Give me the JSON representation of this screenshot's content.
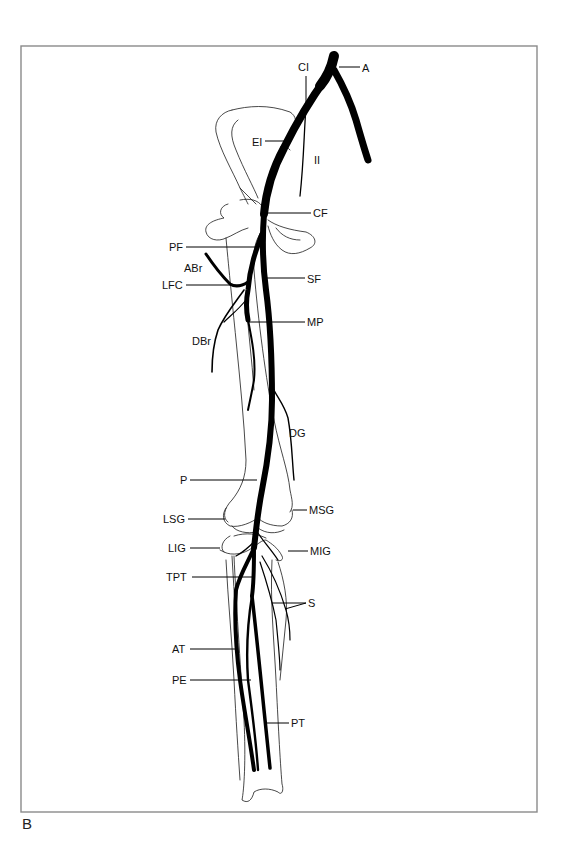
{
  "figure": {
    "panel_letter": "B",
    "frame": {
      "x": 21,
      "y": 46,
      "width": 516,
      "height": 766
    }
  },
  "labels": [
    {
      "id": "A",
      "text": "A",
      "tx": 362,
      "ty": 72,
      "line": [
        [
          339,
          67
        ],
        [
          360,
          67
        ]
      ]
    },
    {
      "id": "CI",
      "text": "CI",
      "tx": 298,
      "ty": 71,
      "line": [
        [
          306,
          76
        ],
        [
          306,
          104
        ]
      ]
    },
    {
      "id": "EI",
      "text": "EI",
      "tx": 252,
      "ty": 146,
      "line": [
        [
          265,
          141
        ],
        [
          287,
          141
        ]
      ]
    },
    {
      "id": "II",
      "text": "II",
      "tx": 314,
      "ty": 164,
      "line": []
    },
    {
      "id": "CF",
      "text": "CF",
      "tx": 313,
      "ty": 217,
      "line": [
        [
          267,
          213
        ],
        [
          311,
          213
        ]
      ]
    },
    {
      "id": "PF",
      "text": "PF",
      "tx": 169,
      "ty": 251,
      "line": [
        [
          186,
          247
        ],
        [
          256,
          247
        ]
      ]
    },
    {
      "id": "ABr",
      "text": "ABr",
      "tx": 184,
      "ty": 272,
      "line": []
    },
    {
      "id": "LFC",
      "text": "LFC",
      "tx": 162,
      "ty": 289,
      "line": [
        [
          186,
          285
        ],
        [
          241,
          285
        ]
      ]
    },
    {
      "id": "SF",
      "text": "SF",
      "tx": 307,
      "ty": 283,
      "line": [
        [
          266,
          278
        ],
        [
          305,
          278
        ]
      ]
    },
    {
      "id": "MP",
      "text": "MP",
      "tx": 307,
      "ty": 326,
      "line": [
        [
          248,
          322
        ],
        [
          305,
          322
        ]
      ]
    },
    {
      "id": "DBr",
      "text": "DBr",
      "tx": 192,
      "ty": 345,
      "line": []
    },
    {
      "id": "DG",
      "text": "DG",
      "tx": 289,
      "ty": 437,
      "line": []
    },
    {
      "id": "P",
      "text": "P",
      "tx": 180,
      "ty": 484,
      "line": [
        [
          190,
          480
        ],
        [
          257,
          480
        ]
      ]
    },
    {
      "id": "LSG",
      "text": "LSG",
      "tx": 163,
      "ty": 523,
      "line": [
        [
          188,
          519
        ],
        [
          225,
          519
        ]
      ]
    },
    {
      "id": "MSG",
      "text": "MSG",
      "tx": 309,
      "ty": 514,
      "line": [
        [
          293,
          510
        ],
        [
          307,
          510
        ]
      ]
    },
    {
      "id": "LIG",
      "text": "LIG",
      "tx": 168,
      "ty": 552,
      "line": [
        [
          190,
          548
        ],
        [
          220,
          548
        ]
      ]
    },
    {
      "id": "MIG",
      "text": "MIG",
      "tx": 310,
      "ty": 555,
      "line": [
        [
          288,
          551
        ],
        [
          308,
          551
        ]
      ]
    },
    {
      "id": "TPT",
      "text": "TPT",
      "tx": 166,
      "ty": 581,
      "line": [
        [
          192,
          577
        ],
        [
          252,
          577
        ]
      ]
    },
    {
      "id": "S",
      "text": "S",
      "tx": 308,
      "ty": 607,
      "line": [
        [
          272,
          603
        ],
        [
          306,
          603
        ],
        [
          285,
          609
        ],
        [
          306,
          603
        ]
      ]
    },
    {
      "id": "AT",
      "text": "AT",
      "tx": 172,
      "ty": 653,
      "line": [
        [
          190,
          649
        ],
        [
          235,
          649
        ]
      ]
    },
    {
      "id": "PE",
      "text": "PE",
      "tx": 172,
      "ty": 684,
      "line": [
        [
          190,
          680
        ],
        [
          251,
          680
        ]
      ]
    },
    {
      "id": "PT",
      "text": "PT",
      "tx": 291,
      "ty": 727,
      "line": [
        [
          267,
          723
        ],
        [
          289,
          723
        ]
      ]
    }
  ],
  "legend_terms": {
    "A": "Aorta",
    "CI": "Common iliac",
    "EI": "External iliac",
    "II": "Internal iliac",
    "CF": "Common femoral",
    "PF": "Profunda femoris",
    "ABr": "Ascending branch",
    "LFC": "Lateral femoral circumflex",
    "SF": "Superficial femoral",
    "MP": "Muscular perforator",
    "DBr": "Descending branch",
    "DG": "Descending genicular",
    "P": "Popliteal",
    "LSG": "Lateral superior genicular",
    "MSG": "Medial superior genicular",
    "LIG": "Lateral inferior genicular",
    "MIG": "Medial inferior genicular",
    "TPT": "Tibioperoneal trunk",
    "S": "Sural",
    "AT": "Anterior tibial",
    "PE": "Peroneal",
    "PT": "Posterior tibial"
  },
  "colors": {
    "artery": "#000000",
    "bone": "#1a1a1a",
    "frame": "#8a8a8a",
    "background": "#ffffff"
  }
}
